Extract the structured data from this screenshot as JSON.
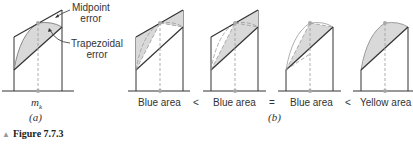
{
  "annotations": {
    "midpoint_error": [
      "Midpoint",
      "error"
    ],
    "trapezoidal_error": [
      "Trapezoidal",
      "error"
    ]
  },
  "panel_a": {
    "x_label": "m",
    "x_label_sub": "k",
    "caption": "(a)"
  },
  "panel_b": {
    "labels": [
      "Blue area",
      "Blue area",
      "Blue area",
      "Yellow area"
    ],
    "comparators": [
      "<",
      "=",
      "<"
    ],
    "caption": "(b)"
  },
  "figure": {
    "caption": "Figure 7.7.3",
    "marker": "triangle-icon"
  },
  "colors": {
    "fill": "#d9d9d9",
    "line": "#333333",
    "dash": "#999999",
    "point": "#a8a8a8"
  }
}
